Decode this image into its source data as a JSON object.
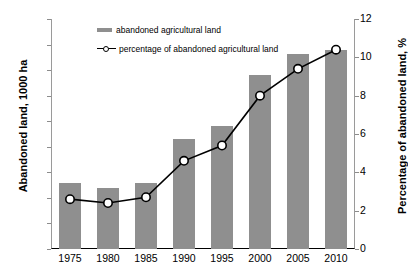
{
  "chart_data": {
    "type": "bar",
    "title": "",
    "categories": [
      "1975",
      "1980",
      "1985",
      "1990",
      "1995",
      "2000",
      "2005",
      "2010"
    ],
    "xlabel": "",
    "series": [
      {
        "name": "abandoned agricultural land",
        "type": "bar",
        "axis": "left",
        "values": [
          130,
          120,
          130,
          215,
          240,
          340,
          382,
          390
        ],
        "color": "#8f8f8f"
      },
      {
        "name": "percentage of abandoned agricultural land",
        "type": "line",
        "axis": "right",
        "values": [
          2.6,
          2.4,
          2.7,
          4.6,
          5.4,
          8.0,
          9.4,
          10.4
        ],
        "color": "#000000"
      }
    ],
    "left_axis": {
      "label": "Abandoned land, 1000 ha",
      "ticks": [
        0,
        50,
        100,
        150,
        200,
        250,
        300,
        350,
        400,
        450
      ],
      "ylim": [
        0,
        450
      ]
    },
    "right_axis": {
      "label": "Percentage of abandoned land, %",
      "ticks": [
        0,
        2,
        4,
        6,
        8,
        10,
        12
      ],
      "ylim": [
        0,
        12
      ]
    },
    "grid": false,
    "legend": {
      "position": "top-left-inside",
      "entries": [
        "abandoned agricultural land",
        "percentage of abandoned agricultural land"
      ]
    }
  }
}
